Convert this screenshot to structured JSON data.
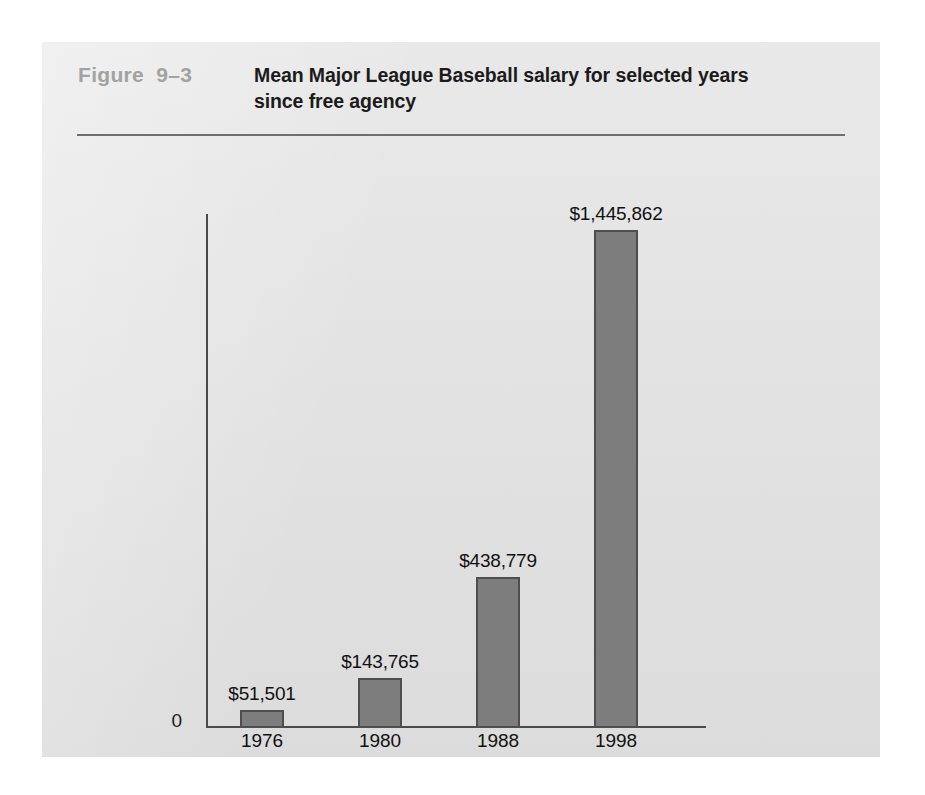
{
  "figure": {
    "number": "Figure  9–3",
    "title": "Mean Major League Baseball salary for selected years since free agency"
  },
  "axis": {
    "origin_label": "0"
  },
  "colors": {
    "card_background": "#e3e3e3",
    "page_background": "#ffffff",
    "bar_fill": "#7d7d7d",
    "bar_border": "#4e4e4e",
    "axis": "#4a4a4a",
    "title_text": "#1b1b1b",
    "figure_number_text": "#a2a2a2",
    "rule": "#6f6f6f"
  },
  "chart_data": {
    "type": "bar",
    "title": "Mean Major League Baseball salary for selected years since free agency",
    "xlabel": "",
    "ylabel": "",
    "categories": [
      "1976",
      "1980",
      "1988",
      "1998"
    ],
    "values": [
      51501,
      143765,
      438779,
      1445862
    ],
    "value_labels": [
      "$51,501",
      "$143,765",
      "$438,779",
      "$1,445,862"
    ],
    "ylim": [
      0,
      1445862
    ],
    "grid": false,
    "legend": null
  }
}
